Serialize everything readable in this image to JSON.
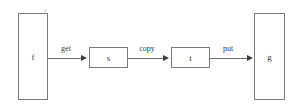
{
  "diagram": {
    "background_color": "#ffffff",
    "stroke_color": "#7a7a7a",
    "text_color": "#3a3a3a",
    "arrow_color": "#3c3c3c",
    "nodes": [
      {
        "id": "f",
        "label": "f",
        "shape": "tall-rectangle"
      },
      {
        "id": "s",
        "label": "s",
        "shape": "rectangle"
      },
      {
        "id": "t",
        "label": "t",
        "shape": "rectangle"
      },
      {
        "id": "g",
        "label": "g",
        "shape": "tall-rectangle"
      }
    ],
    "edges": [
      {
        "id": "get",
        "label": "get",
        "from": "f",
        "to": "s",
        "arrow": "right"
      },
      {
        "id": "copy",
        "label": "copy",
        "from": "s",
        "to": "t",
        "arrow": "right"
      },
      {
        "id": "put",
        "label": "put",
        "from": "t",
        "to": "g",
        "arrow": "right"
      }
    ]
  }
}
